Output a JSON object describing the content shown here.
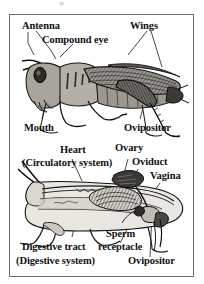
{
  "figure": {
    "kind": "biology-textbook-figure",
    "border_color": "#6a6a6a",
    "background": "#ffffff",
    "ink_color": "#111111"
  },
  "panels": [
    {
      "id": "external-anatomy",
      "name": "External anatomy of a grasshopper (lateral view)",
      "labels": [
        {
          "id": "antenna",
          "text": "Antenna",
          "x": 12,
          "y": 6,
          "size": "s11"
        },
        {
          "id": "wings",
          "text": "Wings",
          "x": 120,
          "y": 6,
          "size": "s11"
        },
        {
          "id": "compound-eye",
          "text": "Compound eye",
          "x": 32,
          "y": 20,
          "size": "s11"
        },
        {
          "id": "mouth",
          "text": "Mouth",
          "x": 14,
          "y": 108,
          "size": "s11"
        },
        {
          "id": "ovipositor",
          "text": "Ovipositor",
          "x": 114,
          "y": 108,
          "size": "s11"
        }
      ]
    },
    {
      "id": "internal-anatomy",
      "name": "Internal anatomy of a grasshopper (sagittal section)",
      "labels": [
        {
          "id": "heart",
          "text": "Heart",
          "x": 50,
          "y": 130,
          "size": "s11"
        },
        {
          "id": "circulatory-system",
          "text": "(Circulatory system)",
          "x": 12,
          "y": 143,
          "size": "s11"
        },
        {
          "id": "ovary",
          "text": "Ovary",
          "x": 105,
          "y": 128,
          "size": "s11"
        },
        {
          "id": "oviduct",
          "text": "Oviduct",
          "x": 122,
          "y": 142,
          "size": "s11"
        },
        {
          "id": "vagina",
          "text": "Vagina",
          "x": 140,
          "y": 156,
          "size": "s11"
        },
        {
          "id": "sperm",
          "text": "Sperm",
          "x": 96,
          "y": 214,
          "size": "s11"
        },
        {
          "id": "sperm-receptacle",
          "text": "receptacle",
          "x": 88,
          "y": 227,
          "size": "s11"
        },
        {
          "id": "digestive-tract",
          "text": "Digestive tract",
          "x": 12,
          "y": 227,
          "size": "s11"
        },
        {
          "id": "digestive-system",
          "text": "(Digestive system)",
          "x": 6,
          "y": 241,
          "size": "s11"
        },
        {
          "id": "ovipositor-2",
          "text": "Ovipositor",
          "x": 118,
          "y": 241,
          "size": "s11"
        }
      ]
    }
  ],
  "colors": {
    "ink": "#111111",
    "frame": "#6a6a6a",
    "body_fill_light": "#d8d5cf",
    "body_fill_mid": "#b0aca4",
    "body_fill_dark": "#6f6c66",
    "leader_line": "#1a1a1a",
    "internal_fill": "#e7e5e0",
    "gut_fill": "#cfcdc7"
  }
}
